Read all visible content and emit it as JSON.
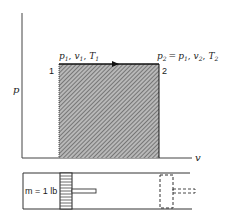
{
  "diagram": {
    "type": "pv-diagram-constant-pressure",
    "axes": {
      "y_label": "p",
      "x_label": "v"
    },
    "states": [
      {
        "id": "1",
        "label": "1",
        "properties_text": "p1, v1, T1",
        "parts": [
          [
            "p",
            "1"
          ],
          [
            "v",
            "1"
          ],
          [
            "T",
            "1"
          ]
        ]
      },
      {
        "id": "2",
        "label": "2",
        "properties_text": "p2 = p1, v2, T2",
        "parts": [
          [
            "p",
            "2"
          ],
          [
            "p",
            "1"
          ],
          [
            "v",
            "2"
          ],
          [
            "T",
            "2"
          ]
        ]
      }
    ],
    "process": {
      "from": "1",
      "to": "2",
      "direction": "right",
      "kind": "constant pressure"
    },
    "work_area": {
      "fill": "hatched",
      "color": "#555555"
    },
    "piston_cylinder": {
      "mass_label": "m = 1 lb",
      "initial_piston": "solid",
      "final_piston": "dashed"
    },
    "text": {
      "p": "p",
      "v": "v",
      "one": "1",
      "two": "2",
      "sub1": "1",
      "sub2": "2",
      "eq": "=",
      "comma": ",",
      "P": "p",
      "V": "v",
      "T": "T",
      "mass": "m = 1 lb"
    }
  }
}
